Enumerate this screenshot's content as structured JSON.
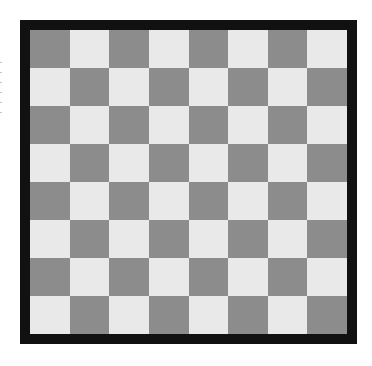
{
  "board": {
    "rows": 8,
    "cols": 8,
    "top_left_color": "dark",
    "colors": {
      "dark": "#8c8c8c",
      "light": "#e9e9e9",
      "border": "#111111",
      "background": "#ffffff"
    }
  }
}
